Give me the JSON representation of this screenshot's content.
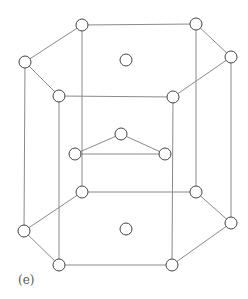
{
  "figure": {
    "label": "(e)",
    "line_color": "#8a8a8a",
    "atom_stroke": "#444444",
    "atom_fill": "#ffffff",
    "atom_radius": 6,
    "atoms": {
      "top_layer": [
        [
          82,
          25
        ],
        [
          196,
          24
        ],
        [
          231,
          57
        ],
        [
          173,
          97
        ],
        [
          59,
          96
        ],
        [
          25,
          62
        ]
      ],
      "top_center": [
        [
          126,
          60
        ]
      ],
      "middle_layer": [
        [
          121,
          134
        ],
        [
          75,
          154
        ],
        [
          165,
          154
        ]
      ],
      "bottom_layer": [
        [
          82,
          192
        ],
        [
          196,
          192
        ],
        [
          231,
          223
        ],
        [
          172,
          265
        ],
        [
          59,
          265
        ],
        [
          24,
          231
        ]
      ],
      "bottom_center": [
        [
          126,
          229
        ]
      ]
    }
  }
}
